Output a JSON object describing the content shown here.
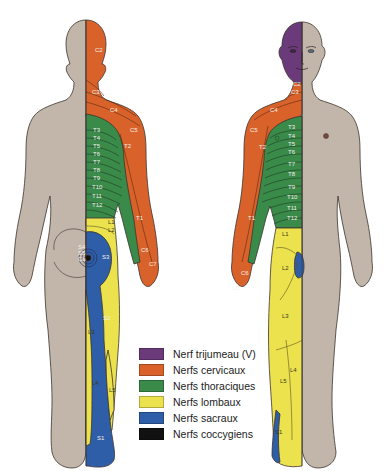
{
  "colors": {
    "skin": "#c2b5aa",
    "outline": "#3b332d",
    "trigeminal": "#6b3a7b",
    "cervical": "#d9622b",
    "thoracic": "#3a8a4a",
    "lumbar": "#ece24e",
    "sacral": "#2f5ea8",
    "coccygeal": "#111111"
  },
  "legend": [
    {
      "label": "Nerf trijumeau (V)",
      "color": "#6b3a7b"
    },
    {
      "label": "Nerfs cervicaux",
      "color": "#d9622b"
    },
    {
      "label": "Nerfs thoraciques",
      "color": "#3a8a4a"
    },
    {
      "label": "Nerfs lombaux",
      "color": "#ece24e"
    },
    {
      "label": "Nerfs sacraux",
      "color": "#2f5ea8"
    },
    {
      "label": "Nerfs coccygiens",
      "color": "#111111"
    }
  ],
  "posterior_view": {
    "labels": {
      "c2": "C2",
      "c3": "C3",
      "c4": "C4",
      "c5": "C5",
      "t2": "T2",
      "t3": "T3",
      "t4": "T4",
      "t5": "T5",
      "t6": "T6",
      "t7": "T7",
      "t8": "T8",
      "t9": "T9",
      "t10": "T10",
      "t11": "T11",
      "t12": "T12",
      "t1": "T1",
      "c6": "C6",
      "c7": "C7",
      "l1": "L1",
      "l2": "L2",
      "l3": "L3",
      "l4": "L4",
      "l5": "L5",
      "s2": "S2",
      "s3": "S3",
      "s1": "S1",
      "s4": "S4",
      "s5": "S5",
      "co": "Co"
    }
  },
  "anterior_view": {
    "labels": {
      "c2": "C2",
      "c3": "C3",
      "c4": "C4",
      "c5": "C5",
      "t2": "T2",
      "t3": "T3",
      "t4": "T4",
      "t5": "T5",
      "t6": "T6",
      "t7": "T7",
      "t8": "T8",
      "t9": "T9",
      "t10": "T10",
      "t11": "T11",
      "t12": "T12",
      "t1": "T1",
      "c6": "C6",
      "c7": "C7",
      "l1": "L1",
      "l2": "L2",
      "l3": "L3",
      "l4": "L4",
      "l5": "L5",
      "s1": "S1"
    }
  }
}
